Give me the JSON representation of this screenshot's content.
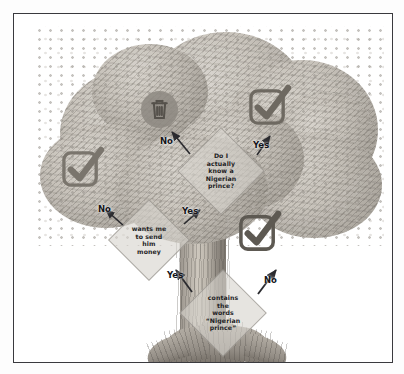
{
  "poster": {
    "title": "Nigerian prince email decision tree",
    "frame_color": "#3a3a3e",
    "background_color": "#ffffff",
    "overlay_color": "#1d1d1f"
  },
  "scene": {
    "subject": "tree",
    "style": "grayscale photograph",
    "parts": {
      "canopy": "leafy-canopy",
      "trunk": "tree-trunk",
      "roots": "tree-roots"
    }
  },
  "flow": {
    "nodes": [
      {
        "id": "know-prince",
        "shape": "diamond",
        "text": "Do I\nactually\nknow a\nNigerian\nprince?"
      },
      {
        "id": "wants-money",
        "shape": "diamond",
        "text": "wants me\nto send\nhim\nmoney"
      },
      {
        "id": "contains-words",
        "shape": "diamond",
        "text": "contains\nthe\nwords\n“Nigerian\nprince”"
      }
    ],
    "edges": [
      {
        "id": "know-no",
        "label": "No",
        "from": "know-prince",
        "to": "delete-icon"
      },
      {
        "id": "know-yes",
        "label": "Yes",
        "from": "know-prince",
        "to": "keep-top-right"
      },
      {
        "id": "money-no",
        "label": "No",
        "from": "wants-money",
        "to": "keep-left"
      },
      {
        "id": "money-yes",
        "label": "Yes",
        "from": "wants-money",
        "to": "know-prince"
      },
      {
        "id": "words-yes",
        "label": "Yes",
        "from": "contains-words",
        "to": "wants-money"
      },
      {
        "id": "words-no",
        "label": "No",
        "from": "contains-words",
        "to": "keep-right"
      }
    ],
    "outcomes": [
      {
        "id": "delete-icon",
        "icon": "trash-icon",
        "meaning": "delete"
      },
      {
        "id": "keep-top-right",
        "icon": "checkbox-checked-icon",
        "meaning": "keep"
      },
      {
        "id": "keep-left",
        "icon": "checkbox-checked-icon",
        "meaning": "keep"
      },
      {
        "id": "keep-right",
        "icon": "checkbox-checked-icon",
        "meaning": "keep"
      }
    ]
  }
}
